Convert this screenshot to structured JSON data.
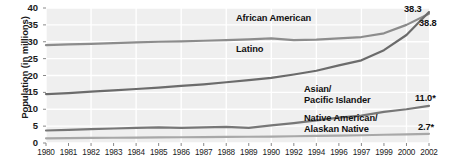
{
  "chart_data": {
    "type": "line",
    "title": "",
    "xlabel": "",
    "ylabel": "Population (in millions)",
    "ylim": [
      0,
      40
    ],
    "ytick_values": [
      0,
      5,
      10,
      15,
      20,
      25,
      30,
      35,
      40
    ],
    "ytick_labels": [
      "0",
      "5",
      "10",
      "15",
      "20",
      "25",
      "30",
      "35",
      "40"
    ],
    "grid": true,
    "legend_position": "inline-annotations",
    "x": [
      1980,
      1981,
      1982,
      1983,
      1984,
      1985,
      1986,
      1987,
      1988,
      1989,
      1990,
      1992,
      1994,
      1996,
      1997,
      1999,
      2000,
      2002
    ],
    "xtick_labels": [
      "1980",
      "1981",
      "1982",
      "1983",
      "1984",
      "1985",
      "1986",
      "1987",
      "1988",
      "1989",
      "1990",
      "1992",
      "1994",
      "1996",
      "1997",
      "1999",
      "2000",
      "2002"
    ],
    "series": [
      {
        "name": "African American",
        "color": "#8c8c8c",
        "values": [
          29.0,
          29.2,
          29.4,
          29.6,
          29.8,
          30.0,
          30.1,
          30.3,
          30.5,
          30.7,
          31.0,
          30.5,
          30.6,
          31.0,
          31.4,
          32.5,
          35.0,
          38.3
        ]
      },
      {
        "name": "Latino",
        "color": "#6b6b6b",
        "values": [
          14.5,
          14.8,
          15.2,
          15.6,
          16.0,
          16.4,
          16.9,
          17.4,
          18.0,
          18.6,
          19.3,
          20.3,
          21.4,
          23.0,
          24.5,
          27.5,
          32.0,
          38.8
        ]
      },
      {
        "name": "Asian/\nPacific Islander",
        "color": "#777777",
        "values": [
          3.7,
          3.9,
          4.1,
          4.3,
          4.5,
          4.6,
          4.5,
          4.6,
          4.8,
          4.5,
          5.2,
          5.9,
          6.7,
          7.5,
          8.1,
          9.2,
          10.0,
          11.0
        ]
      },
      {
        "name": "Native American/\nAlaskan Native",
        "color": "#a8a8a8",
        "values": [
          1.4,
          1.45,
          1.5,
          1.55,
          1.6,
          1.65,
          1.7,
          1.75,
          1.8,
          1.85,
          1.9,
          2.0,
          2.1,
          2.2,
          2.3,
          2.45,
          2.55,
          2.7
        ]
      }
    ],
    "annotations": [
      {
        "name": "african-american-label",
        "text": "African American"
      },
      {
        "name": "latino-label",
        "text": "Latino"
      },
      {
        "name": "asian-pacific-islander-label",
        "text": "Asian/\nPacific Islander"
      },
      {
        "name": "native-american-label",
        "text": "Native American/\nAlaskan Native"
      }
    ],
    "end_value_labels": [
      {
        "name": "latino-end-value",
        "text": "38.3"
      },
      {
        "name": "african-american-end-value",
        "text": "38.8"
      },
      {
        "name": "asian-pacific-islander-end-value",
        "text": "11.0*"
      },
      {
        "name": "native-american-end-value",
        "text": "2.7*"
      }
    ]
  },
  "colors": {
    "plot_background": "#efefef",
    "gridline": "#ffffff",
    "axis_text": "#1b1b1b",
    "page_background": "#ffffff"
  }
}
